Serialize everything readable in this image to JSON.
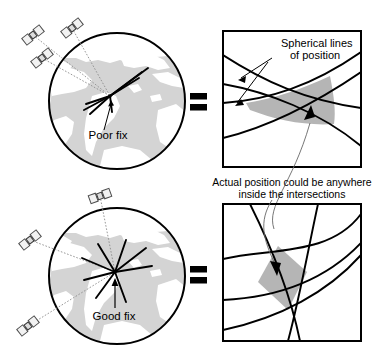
{
  "figure": {
    "width": 375,
    "height": 358,
    "background": "#ffffff"
  },
  "colors": {
    "ink": "#000000",
    "ocean": "#d4d4d4",
    "land": "#ffffff",
    "intersection_fill": "#b5b5b5",
    "satellite_body": "#f0f0f0",
    "sight_line": "#9a9a9a"
  },
  "panels": {
    "top_left": {
      "name": "poor-fix-globe",
      "label": "Poor fix",
      "satellite_count": 3,
      "satellite_labels": [
        "satellite-1",
        "satellite-2",
        "satellite-3"
      ],
      "geometry_note": "satellites clustered close together"
    },
    "bottom_left": {
      "name": "good-fix-globe",
      "label": "Good fix",
      "satellite_count": 3,
      "satellite_labels": [
        "satellite-1",
        "satellite-2",
        "satellite-3"
      ],
      "geometry_note": "satellites widely spread"
    },
    "top_right": {
      "name": "poor-fix-intersection",
      "annotation": "Spherical lines\nof position",
      "annotation_line1": "Spherical lines",
      "annotation_line2": "of position",
      "lines_of_position": 4,
      "intersection_shape": "large elongated lens"
    },
    "bottom_right": {
      "name": "good-fix-intersection",
      "lines_of_position": 4,
      "intersection_shape": "small compact diamond"
    }
  },
  "equals_signs": [
    {
      "name": "equals-top",
      "symbol": "="
    },
    {
      "name": "equals-bottom",
      "symbol": "="
    }
  ],
  "caption": {
    "line1": "Actual position could be anywhere",
    "line2": "inside the intersections"
  }
}
